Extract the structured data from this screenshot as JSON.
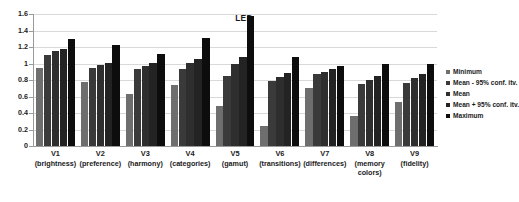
{
  "chart_data": {
    "type": "bar",
    "title": "LED",
    "xlabel": "",
    "ylabel": "",
    "ylim": [
      0,
      1.6
    ],
    "yticks": [
      "0",
      "0.2",
      "0.4",
      "0.6",
      "0.8",
      "1",
      "1.2",
      "1.4",
      "1.6"
    ],
    "grid": true,
    "legend_position": "right",
    "categories": [
      "V1",
      "V2",
      "V3",
      "V4",
      "V5",
      "V6",
      "V7",
      "V8",
      "V9"
    ],
    "category_sublabels": [
      "(brightness)",
      "(preference)",
      "(harmony)",
      "(categories)",
      "(gamut)",
      "(transitions)",
      "(differences)",
      "(memory colors)",
      "(fidelity)"
    ],
    "series": [
      {
        "name": "Minimum",
        "color": "#6e6e6e",
        "values": [
          0.95,
          0.77,
          0.63,
          0.74,
          0.48,
          0.24,
          0.7,
          0.36,
          0.53
        ]
      },
      {
        "name": "Mean - 95% conf. itv.",
        "color": "#3a3a3a",
        "values": [
          1.1,
          0.95,
          0.93,
          0.93,
          0.85,
          0.79,
          0.87,
          0.75,
          0.76
        ]
      },
      {
        "name": "Mean",
        "color": "#2e2e2e",
        "values": [
          1.15,
          0.98,
          0.97,
          1.01,
          1.0,
          0.84,
          0.9,
          0.8,
          0.82
        ]
      },
      {
        "name": "Mean + 95% conf. itv.",
        "color": "#232323",
        "values": [
          1.17,
          1.01,
          1.01,
          1.06,
          1.08,
          0.88,
          0.93,
          0.85,
          0.87
        ]
      },
      {
        "name": "Maximum",
        "color": "#0d0d0d",
        "values": [
          1.3,
          1.23,
          1.12,
          1.31,
          1.57,
          1.08,
          0.97,
          1.0,
          1.0
        ]
      }
    ]
  }
}
